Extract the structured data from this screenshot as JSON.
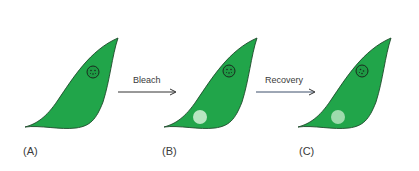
{
  "figure": {
    "type": "FRAP schematic",
    "background": "#ffffff",
    "cell_fill": "#21a54a",
    "cell_stroke": "#1d4a2a",
    "bleach_spot_fill": "#b8e6c2",
    "recovered_spot_fill": "#9edbad",
    "arrow_color": "#333333",
    "recovery_arrow_color": "#3d4f6b"
  },
  "panels": [
    {
      "id": "A",
      "label": "(A)",
      "state": "before bleach",
      "bleach_spot": false
    },
    {
      "id": "B",
      "label": "(B)",
      "state": "after bleach",
      "bleach_spot": true
    },
    {
      "id": "C",
      "label": "(C)",
      "state": "after recovery",
      "bleach_spot": true
    }
  ],
  "arrows": [
    {
      "label": "Bleach",
      "from": "A",
      "to": "B"
    },
    {
      "label": "Recovery",
      "from": "B",
      "to": "C"
    }
  ],
  "icons": {
    "cell": "leaf-shaped-cell",
    "nucleus": "nucleus-circle-icon",
    "bleach_spot": "bleached-region-circle"
  }
}
